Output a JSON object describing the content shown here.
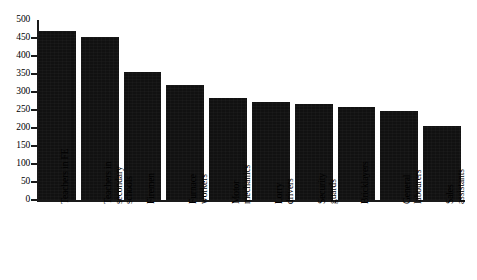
{
  "chart_data": {
    "type": "bar",
    "title": "",
    "subtitle": "",
    "xlabel": "",
    "ylabel": "",
    "ylim": [
      0,
      500
    ],
    "yticks": [
      0,
      50,
      100,
      150,
      200,
      250,
      300,
      350,
      400,
      450,
      500
    ],
    "grid": false,
    "legend": null,
    "bar_color": "#111111",
    "axis_color": "#1a1a1a",
    "categories": [
      "Teachers in FE",
      "Teachers in secondary schools",
      "Firemen",
      "Furnace workers",
      "Motor mechanics",
      "Lorry drivers",
      "Security guards",
      "Bricklayers",
      "General labourers",
      "Sales assistants"
    ],
    "category_lines": [
      [
        "Teachers in FE"
      ],
      [
        "Teachers in",
        "secondary",
        "schools"
      ],
      [
        "Firemen"
      ],
      [
        "Furnace",
        "workers"
      ],
      [
        "Motor",
        "mechanics"
      ],
      [
        "Lorry",
        "drivers"
      ],
      [
        "Security",
        "guards"
      ],
      [
        "Bricklayers"
      ],
      [
        "General",
        "labourers"
      ],
      [
        "Sales",
        "assistants"
      ]
    ],
    "values": [
      470,
      452,
      355,
      320,
      282,
      273,
      268,
      258,
      248,
      205
    ]
  }
}
